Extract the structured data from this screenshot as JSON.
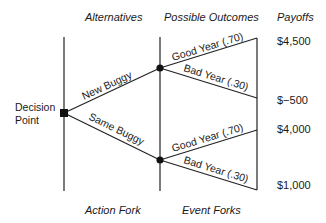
{
  "diagram": {
    "type": "decision-tree",
    "column_headers": {
      "alternatives": "Alternatives",
      "possible_outcomes": "Possible Outcomes",
      "payoffs": "Payoffs"
    },
    "footer_labels": {
      "action_fork": "Action Fork",
      "event_forks": "Event Forks"
    },
    "decision_point": {
      "label_line1": "Decision",
      "label_line2": "Point"
    },
    "alternatives": [
      {
        "label": "New Buggy",
        "outcomes": [
          {
            "label": "Good Year (.70)",
            "payoff": "$4,500"
          },
          {
            "label": "Bad Year (.30)",
            "payoff": "$−500"
          }
        ]
      },
      {
        "label": "Same Buggy",
        "outcomes": [
          {
            "label": "Good Year (.70)",
            "payoff": "$4,000"
          },
          {
            "label": "Bad Year (.30)",
            "payoff": "$1,000"
          }
        ]
      }
    ]
  }
}
